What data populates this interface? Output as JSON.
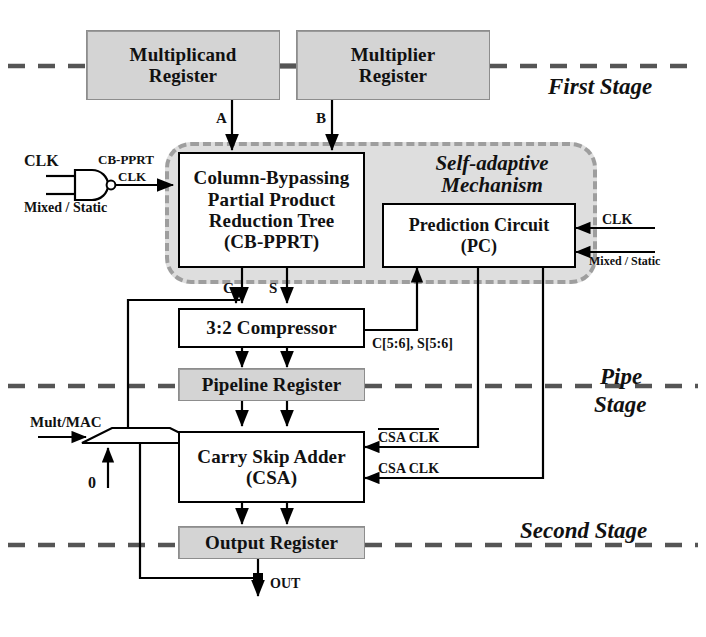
{
  "diagram": {
    "stage_labels": {
      "first": "First Stage",
      "pipe_line1": "Pipe",
      "pipe_line2": "Stage",
      "second": "Second Stage"
    },
    "region": {
      "self_adaptive_line1": "Self-adaptive",
      "self_adaptive_line2": "Mechanism"
    },
    "blocks": {
      "multiplicand_register": {
        "line1": "Multiplicand",
        "line2": "Register"
      },
      "multiplier_register": {
        "line1": "Multiplier",
        "line2": "Register"
      },
      "cb_pprt": {
        "line1": "Column-Bypassing",
        "line2": "Partial Product",
        "line3": "Reduction Tree",
        "line4": "(CB-PPRT)"
      },
      "prediction_circuit": {
        "line1": "Prediction Circuit",
        "line2": "(PC)"
      },
      "compressor": {
        "line1": "3:2 Compressor"
      },
      "pipeline_register": {
        "line1": "Pipeline Register"
      },
      "csa": {
        "line1": "Carry Skip Adder",
        "line2": "(CSA)"
      },
      "output_register": {
        "line1": "Output Register"
      }
    },
    "signals": {
      "a": "A",
      "b": "B",
      "c": "C",
      "s": "S",
      "clk_gate_in": "CLK",
      "gate_out_line1": "CB-PPRT",
      "gate_out_line2": "CLK",
      "mixed_static_left": "Mixed / Static",
      "clk_pc": "CLK",
      "mixed_static_right": "Mixed / Static",
      "cs_bits": "C[5:6], S[5:6]",
      "csa_clk_bar": "CSA CLK",
      "csa_clk": "CSA CLK",
      "mult_mac": "Mult/MAC",
      "mux_zero": "0",
      "out": "OUT"
    },
    "colors": {
      "register_fill": "#d4d4d4",
      "region_fill": "#dedede",
      "region_border": "#9e9e9e",
      "line": "#000000",
      "stage_dash": "#555555"
    }
  }
}
